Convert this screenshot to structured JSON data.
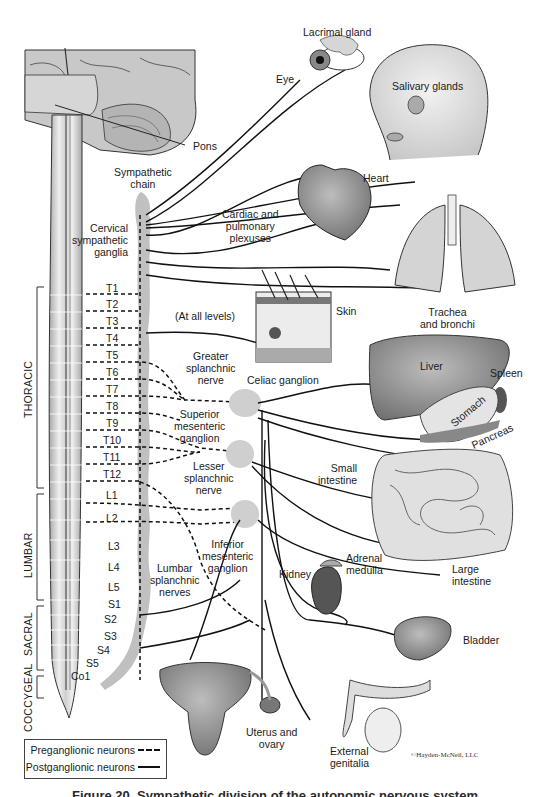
{
  "diagram": {
    "subject": "Sympathetic division of the autonomic nervous system",
    "structures": {
      "pons": "Pons",
      "sympathetic_chain": [
        "Sympathetic",
        "chain"
      ],
      "cervical_ganglia": [
        "Cervical",
        "sympathetic",
        "ganglia"
      ],
      "cardiac_plexuses": [
        "Cardiac and",
        "pulmonary",
        "plexuses"
      ],
      "at_all_levels": "(At all levels)",
      "greater_splanchnic": [
        "Greater",
        "splanchnic",
        "nerve"
      ],
      "celiac_ganglion": "Celiac ganglion",
      "superior_mesenteric": [
        "Superior",
        "mesenteric",
        "ganglion"
      ],
      "lesser_splanchnic": [
        "Lesser",
        "splanchnic",
        "nerve"
      ],
      "inferior_mesenteric": [
        "Inferior",
        "mesenteric",
        "ganglion"
      ],
      "lumbar_splanchnic": [
        "Lumbar",
        "splanchnic",
        "nerves"
      ]
    },
    "organs": {
      "lacrimal_gland": "Lacrimal gland",
      "eye": "Eye",
      "salivary_glands": "Salivary glands",
      "heart": "Heart",
      "trachea": [
        "Trachea",
        "and bronchi"
      ],
      "skin": "Skin",
      "liver": "Liver",
      "spleen": "Spleen",
      "stomach": "Stomach",
      "pancreas": "Pancreas",
      "small_intestine": [
        "Small",
        "intestine"
      ],
      "adrenal_medulla": [
        "Adrenal",
        "medulla"
      ],
      "kidney": "Kidney",
      "large_intestine": [
        "Large",
        "intestine"
      ],
      "bladder": "Bladder",
      "uterus_ovary": [
        "Uterus and",
        "ovary"
      ],
      "external_genitalia": [
        "External",
        "genitalia"
      ]
    },
    "regions": {
      "thoracic": "THORACIC",
      "lumbar": "LUMBAR",
      "sacral": "SACRAL",
      "coccygeal": "COCCYGEAL"
    },
    "segments": [
      "T1",
      "T2",
      "T3",
      "T4",
      "T5",
      "T6",
      "T7",
      "T8",
      "T9",
      "T10",
      "T11",
      "T12",
      "L1",
      "L2",
      "L3",
      "L4",
      "L5",
      "S1",
      "S2",
      "S3",
      "S4",
      "S5",
      "Co1"
    ],
    "legend": {
      "preganglionic": "Preganglionic neurons",
      "postganglionic": "Postganglionic neurons"
    },
    "copyright": "©Hayden-McNeil, LLC",
    "caption": "Figure 20. Sympathetic division of the autonomic nervous system",
    "colors": {
      "nerve": "#111111",
      "chain": "#b8b8b8",
      "organ_dark": "#6a6a6a",
      "organ_mid": "#9a9a9a",
      "organ_light": "#d4d4d4",
      "cord": "#e2e2e2"
    }
  }
}
